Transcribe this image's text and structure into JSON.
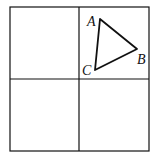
{
  "diagram": {
    "type": "grid-with-triangle",
    "grid": {
      "rows": 2,
      "cols": 2
    },
    "triangle": {
      "vertices": [
        {
          "label": "A",
          "x": 100,
          "y": 19
        },
        {
          "label": "B",
          "x": 137,
          "y": 49
        },
        {
          "label": "C",
          "x": 95,
          "y": 70
        }
      ]
    },
    "labels": {
      "a": "A",
      "b": "B",
      "c": "C"
    },
    "colors": {
      "stroke": "#111111",
      "background": "#ffffff"
    }
  }
}
